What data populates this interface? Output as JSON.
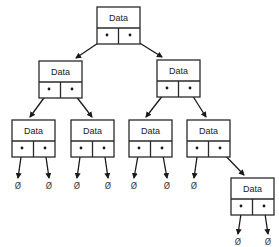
{
  "diagram": {
    "type": "binary-tree",
    "node_label": "Data",
    "null_symbol": "Ø",
    "colors": {
      "stroke": "#2a2a2a",
      "background": "#ffffff"
    },
    "nodes": [
      {
        "id": "root",
        "label": "Data",
        "x": 97,
        "y": 7
      },
      {
        "id": "L",
        "label": "Data",
        "x": 39,
        "y": 61
      },
      {
        "id": "R",
        "label": "Data",
        "x": 157,
        "y": 60
      },
      {
        "id": "LL",
        "label": "Data",
        "x": 12,
        "y": 120
      },
      {
        "id": "LR",
        "label": "Data",
        "x": 71,
        "y": 120
      },
      {
        "id": "RL",
        "label": "Data",
        "x": 129,
        "y": 120
      },
      {
        "id": "RR",
        "label": "Data",
        "x": 187,
        "y": 120
      },
      {
        "id": "RRR",
        "label": "Data",
        "x": 231,
        "y": 178
      }
    ],
    "nulls": [
      {
        "label": "Ø",
        "x": 18,
        "y": 189
      },
      {
        "label": "Ø",
        "x": 49,
        "y": 189
      },
      {
        "label": "Ø",
        "x": 77,
        "y": 189
      },
      {
        "label": "Ø",
        "x": 108,
        "y": 189
      },
      {
        "label": "Ø",
        "x": 134,
        "y": 189
      },
      {
        "label": "Ø",
        "x": 167,
        "y": 189
      },
      {
        "label": "Ø",
        "x": 194,
        "y": 189
      },
      {
        "label": "Ø",
        "x": 238,
        "y": 245
      },
      {
        "label": "Ø",
        "x": 268,
        "y": 245
      }
    ]
  }
}
